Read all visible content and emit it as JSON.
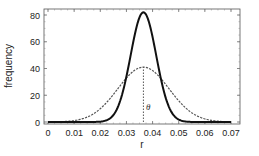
{
  "chart_data": {
    "type": "line",
    "title": "",
    "xlabel": "r",
    "ylabel": "frequency",
    "xlim": [
      0,
      0.07
    ],
    "ylim": [
      0,
      85
    ],
    "xticks": [
      0,
      0.01,
      0.02,
      0.03,
      0.04,
      0.05,
      0.06,
      0.07
    ],
    "xtick_labels": [
      "0",
      "0.01",
      "0.02",
      "0.03",
      "0.04",
      "0.05",
      "0.06",
      "0.07"
    ],
    "yticks": [
      0,
      20,
      40,
      60,
      80
    ],
    "ytick_labels": [
      "0",
      "20",
      "40",
      "60",
      "80"
    ],
    "grid": false,
    "legend": null,
    "series": [
      {
        "name": "narrow distribution",
        "style": "solid",
        "color": "#111111",
        "distribution": "normal",
        "mean": 0.0365,
        "sd": 0.0049,
        "peak": 82,
        "x": [
          0,
          0.01,
          0.02,
          0.025,
          0.03,
          0.0365,
          0.043,
          0.048,
          0.053,
          0.06,
          0.07
        ],
        "values": [
          0,
          0,
          0.3,
          5,
          34,
          82,
          34,
          5.5,
          0.3,
          0,
          0
        ]
      },
      {
        "name": "wide distribution",
        "style": "dashed",
        "color": "#555555",
        "distribution": "normal",
        "mean": 0.0365,
        "sd": 0.0098,
        "peak": 41,
        "x": [
          0,
          0.01,
          0.02,
          0.0265,
          0.0365,
          0.0465,
          0.053,
          0.06,
          0.07
        ],
        "values": [
          0.4,
          2.9,
          10.5,
          24.8,
          41,
          24.8,
          10.5,
          2.3,
          0.4
        ]
      }
    ],
    "annotations": [
      {
        "type": "vline",
        "x": 0.0365,
        "y_from": 0,
        "y_to": 41,
        "style": "dotted"
      },
      {
        "type": "text",
        "text": "θ",
        "x": 0.0375,
        "y": 9
      }
    ]
  }
}
